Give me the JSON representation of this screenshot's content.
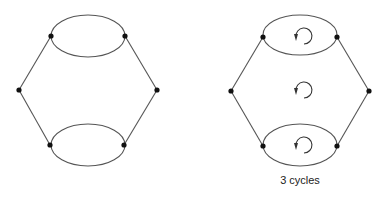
{
  "diagram": {
    "left_graph": {
      "name": "hexagon-graph-with-double-edges",
      "nodes": [
        [
          51,
          36
        ],
        [
          125,
          36
        ],
        [
          19,
          90
        ],
        [
          157,
          90
        ],
        [
          50,
          145
        ],
        [
          124,
          145
        ]
      ],
      "ellipses": [
        {
          "cx": 88,
          "cy": 36,
          "rx": 37,
          "ry": 21
        },
        {
          "cx": 88,
          "cy": 145,
          "rx": 37,
          "ry": 21
        }
      ],
      "edges": [
        [
          [
            51,
            36
          ],
          [
            19,
            90
          ]
        ],
        [
          [
            19,
            90
          ],
          [
            50,
            145
          ]
        ],
        [
          [
            125,
            36
          ],
          [
            157,
            90
          ]
        ],
        [
          [
            157,
            90
          ],
          [
            124,
            145
          ]
        ]
      ]
    },
    "right_graph": {
      "name": "hexagon-graph-with-cycles",
      "nodes": [
        [
          263,
          37
        ],
        [
          337,
          37
        ],
        [
          231,
          91
        ],
        [
          369,
          91
        ],
        [
          263,
          146
        ],
        [
          337,
          146
        ]
      ],
      "ellipses": [
        {
          "cx": 300,
          "cy": 35,
          "rx": 37,
          "ry": 20
        },
        {
          "cx": 300,
          "cy": 145,
          "rx": 37,
          "ry": 21
        }
      ],
      "edges": [
        [
          [
            263,
            37
          ],
          [
            231,
            91
          ]
        ],
        [
          [
            231,
            91
          ],
          [
            263,
            146
          ]
        ],
        [
          [
            337,
            37
          ],
          [
            369,
            91
          ]
        ],
        [
          [
            369,
            91
          ],
          [
            337,
            146
          ]
        ]
      ],
      "cycle_arrows": [
        [
          300,
          36
        ],
        [
          300,
          90
        ],
        [
          300,
          145
        ]
      ],
      "caption": "3 cycles"
    },
    "colors": {
      "line": "#555555",
      "node": "#111111",
      "arrow": "#333333"
    }
  }
}
